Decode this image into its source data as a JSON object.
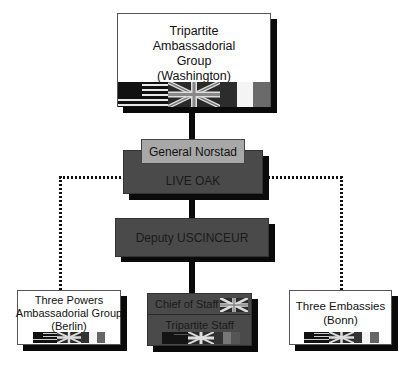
{
  "diagram": {
    "type": "organization-chart",
    "nodes": {
      "washington": {
        "label_lines": [
          "Tripartite",
          "Ambassadorial",
          "Group",
          "(Washington)"
        ],
        "flags": [
          "us-flag",
          "uk-flag",
          "france-flag"
        ]
      },
      "norstad": {
        "label": "General Norstad"
      },
      "live_oak": {
        "label": "LIVE OAK"
      },
      "deputy": {
        "label": "Deputy USCINCEUR"
      },
      "chief_of_staff": {
        "label": "Chief of Staff",
        "flags": [
          "uk-flag"
        ]
      },
      "tripartite_staff": {
        "label": "Tripartite Staff",
        "flags": [
          "us-flag",
          "uk-flag",
          "france-flag"
        ]
      },
      "berlin": {
        "label_lines": [
          "Three Powers",
          "Ambassadorial Group",
          "(Berlin)"
        ],
        "flags": [
          "us-flag",
          "uk-flag",
          "france-flag"
        ]
      },
      "bonn": {
        "label_lines": [
          "Three Embassies",
          "(Bonn)"
        ],
        "flags": [
          "us-flag",
          "uk-flag",
          "france-flag"
        ]
      }
    },
    "edges": [
      {
        "from": "washington",
        "to": "norstad",
        "style": "solid"
      },
      {
        "from": "live_oak",
        "to": "deputy",
        "style": "solid"
      },
      {
        "from": "deputy",
        "to": "chief_of_staff",
        "style": "solid"
      },
      {
        "from": "live_oak",
        "to": "berlin",
        "style": "dotted"
      },
      {
        "from": "live_oak",
        "to": "bonn",
        "style": "dotted"
      }
    ],
    "colors": {
      "dark_box": "#4a4a4a",
      "grey_box": "#a8a8a8",
      "shadow": "#0a0a0a",
      "line": "#0a0a0a"
    }
  }
}
